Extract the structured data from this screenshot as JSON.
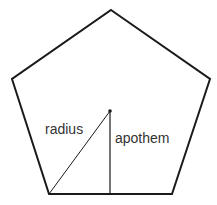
{
  "diagram": {
    "shape": "regular pentagon",
    "labels": {
      "radius": "radius",
      "apothem": "apothem"
    },
    "colors": {
      "stroke": "#1a1a1a",
      "text": "#333333",
      "background": "#ffffff"
    }
  }
}
